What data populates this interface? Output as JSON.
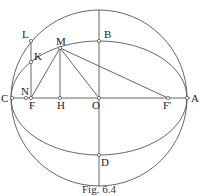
{
  "figure": {
    "caption": "Fig. 6.4",
    "labels": {
      "L": "L",
      "K": "K",
      "M": "M",
      "B": "B",
      "C": "C",
      "N": "N",
      "F": "F",
      "H": "H",
      "O": "O",
      "F_prime": "F′",
      "A": "A",
      "D": "D"
    },
    "geometry": {
      "center": [
        99,
        98
      ],
      "circle_radius": 88,
      "ellipse_semi_major": 88,
      "ellipse_semi_minor": 57
    },
    "colors": {
      "line": "#555555",
      "text": "#222222"
    }
  }
}
